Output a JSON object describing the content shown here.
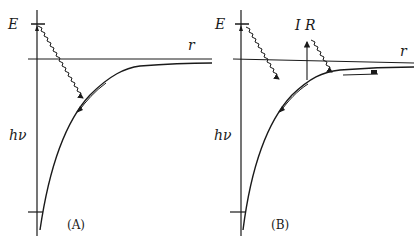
{
  "panels": [
    {
      "id": "A",
      "caption": "(A)",
      "labels": {
        "energy_axis": "E",
        "distance_axis": "r",
        "photon_energy": "hν"
      }
    },
    {
      "id": "B",
      "caption": "(B)",
      "labels": {
        "energy_axis": "E",
        "distance_axis": "r",
        "photon_energy": "hν",
        "infrared": "I R"
      }
    }
  ],
  "colors": {
    "ink": "#1a1a1a",
    "background": "#ffffff"
  }
}
